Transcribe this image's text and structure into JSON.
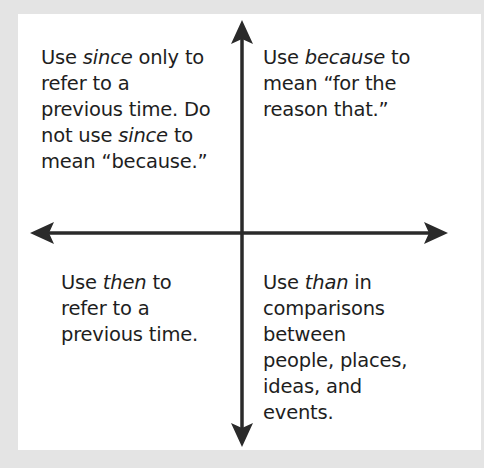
{
  "diagram": {
    "type": "quadrant-chart",
    "colors": {
      "background": "#e4e4e4",
      "panel": "#ffffff",
      "axis": "#2a2a2a",
      "text": "#1e1e1e"
    },
    "axes": {
      "vertical": {
        "arrow_up": true,
        "arrow_down": true
      },
      "horizontal": {
        "arrow_left": true,
        "arrow_right": true
      }
    },
    "quadrants": {
      "top_left": {
        "line1_pre": "Use ",
        "line1_em": "since",
        "line1_post": " only to",
        "line2": "refer to a",
        "line3": "previous time. Do",
        "line4_pre": "not use ",
        "line4_em": "since",
        "line4_post": " to",
        "line5": "mean “because.”"
      },
      "top_right": {
        "line1_pre": "Use ",
        "line1_em": "because",
        "line1_post": " to",
        "line2": "mean “for the",
        "line3": "reason that.”"
      },
      "bottom_left": {
        "line1_pre": "Use ",
        "line1_em": "then",
        "line1_post": " to",
        "line2": "refer to a",
        "line3": "previous time."
      },
      "bottom_right": {
        "line1_pre": "Use ",
        "line1_em": "than",
        "line1_post": " in",
        "line2": "comparisons",
        "line3": "between",
        "line4": "people, places,",
        "line5": "ideas, and",
        "line6": "events."
      }
    }
  }
}
